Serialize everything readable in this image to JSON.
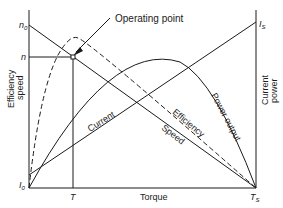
{
  "diagram": {
    "axes": {
      "x_label": "Torque",
      "left_label_line1": "Efficiency",
      "left_label_line2": "speed",
      "right_label_line1": "Current",
      "right_label_line2": "power"
    },
    "ticks": {
      "n0": "n",
      "n0_sub": "0",
      "n": "n",
      "I0": "I",
      "I0_sub": "0",
      "T": "T",
      "Ts": "T",
      "Ts_sub": "S",
      "Is": "I",
      "Is_sub": "S"
    },
    "curves": {
      "current": "Current",
      "efficiency": "Efficiency",
      "speed": "Speed",
      "power": "Power output"
    },
    "annotation": "Operating point"
  }
}
